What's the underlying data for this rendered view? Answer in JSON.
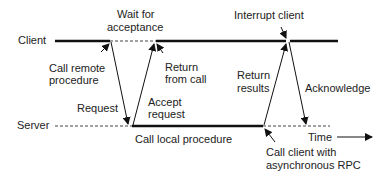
{
  "lanes": {
    "client": "Client",
    "server": "Server"
  },
  "labels": {
    "wait_for_acceptance": [
      "Wait for",
      "acceptance"
    ],
    "interrupt_client": "Interrupt client",
    "call_remote_procedure": [
      "Call remote",
      "procedure"
    ],
    "return_from_call": [
      "Return",
      "from call"
    ],
    "return_results": [
      "Return",
      "results"
    ],
    "acknowledge": "Acknowledge",
    "request": "Request",
    "accept_request": [
      "Accept",
      "request"
    ],
    "call_local_procedure": "Call local procedure",
    "call_client_async": [
      "Call client with",
      "asynchronous RPC"
    ],
    "time": "Time"
  },
  "colors": {
    "line": "#111111",
    "dashed": "#444444",
    "text": "#222222"
  }
}
